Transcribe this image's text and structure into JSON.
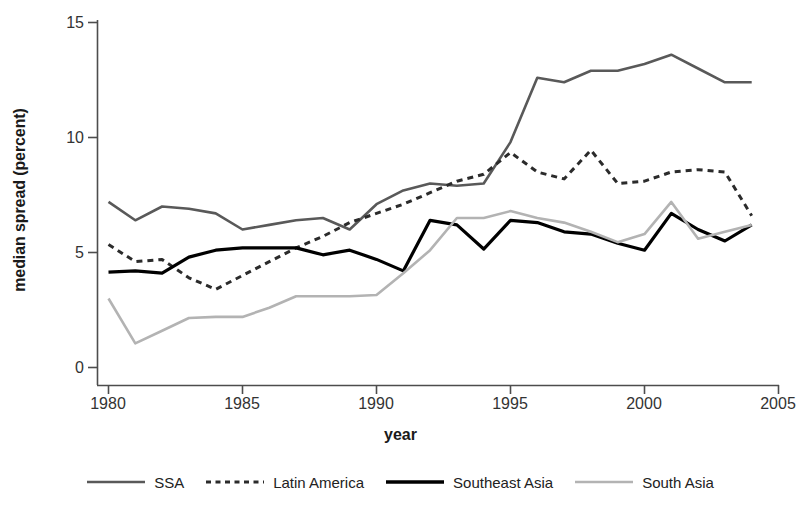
{
  "chart_data": {
    "type": "line",
    "title": "",
    "xlabel": "year",
    "ylabel": "median spread (percent)",
    "xlim": [
      1980,
      2005
    ],
    "ylim": [
      0,
      15
    ],
    "xticks": [
      1980,
      1985,
      1990,
      1995,
      2000,
      2005
    ],
    "yticks": [
      0,
      5,
      10,
      15
    ],
    "grid": false,
    "legend_position": "bottom",
    "x": [
      1980,
      1981,
      1982,
      1983,
      1984,
      1985,
      1986,
      1987,
      1988,
      1989,
      1990,
      1991,
      1992,
      1993,
      1994,
      1995,
      1996,
      1997,
      1998,
      1999,
      2000,
      2001,
      2002,
      2003,
      2004
    ],
    "series": [
      {
        "name": "SSA",
        "color": "#595959",
        "style": "solid",
        "width": 2.6,
        "values": [
          7.2,
          6.4,
          7.0,
          6.9,
          6.7,
          6.0,
          6.2,
          6.4,
          6.5,
          6.0,
          7.1,
          7.7,
          8.0,
          7.9,
          8.0,
          9.8,
          12.6,
          12.4,
          12.9,
          12.9,
          13.2,
          13.6,
          13.0,
          12.4,
          12.4
        ]
      },
      {
        "name": "Latin America",
        "color": "#2b2b2b",
        "style": "dashed",
        "width": 3.0,
        "values": [
          5.35,
          4.6,
          4.7,
          3.9,
          3.4,
          4.0,
          4.6,
          5.2,
          5.7,
          6.3,
          6.7,
          7.1,
          7.6,
          8.1,
          8.4,
          9.35,
          8.5,
          8.2,
          9.45,
          8.0,
          8.1,
          8.5,
          8.6,
          8.5,
          6.6
        ]
      },
      {
        "name": "Southeast Asia",
        "color": "#000000",
        "style": "solid",
        "width": 3.2,
        "values": [
          4.15,
          4.2,
          4.1,
          4.8,
          5.1,
          5.2,
          5.2,
          5.2,
          4.9,
          5.1,
          4.7,
          4.2,
          6.4,
          6.2,
          5.15,
          6.4,
          6.3,
          5.9,
          5.8,
          5.4,
          5.1,
          6.7,
          6.0,
          5.5,
          6.2
        ]
      },
      {
        "name": "South Asia",
        "color": "#b3b3b3",
        "style": "solid",
        "width": 2.6,
        "values": [
          3.0,
          1.05,
          1.6,
          2.15,
          2.2,
          2.2,
          2.6,
          3.1,
          3.1,
          3.1,
          3.15,
          4.1,
          5.1,
          6.5,
          6.5,
          6.8,
          6.5,
          6.3,
          5.9,
          5.45,
          5.8,
          7.2,
          5.6,
          5.9,
          6.2
        ]
      }
    ]
  },
  "axis": {
    "y_tick_labels": [
      "15",
      "10",
      "5",
      "0"
    ],
    "x_tick_labels": [
      "1980",
      "1985",
      "1990",
      "1995",
      "2000",
      "2005"
    ],
    "y_title": "median spread (percent)",
    "x_title": "year"
  },
  "legend": {
    "items": [
      {
        "label": "SSA",
        "color": "#595959",
        "style": "solid"
      },
      {
        "label": "Latin America",
        "color": "#2b2b2b",
        "style": "dashed"
      },
      {
        "label": "Southeast Asia",
        "color": "#000000",
        "style": "solid"
      },
      {
        "label": "South Asia",
        "color": "#b3b3b3",
        "style": "solid"
      }
    ]
  }
}
